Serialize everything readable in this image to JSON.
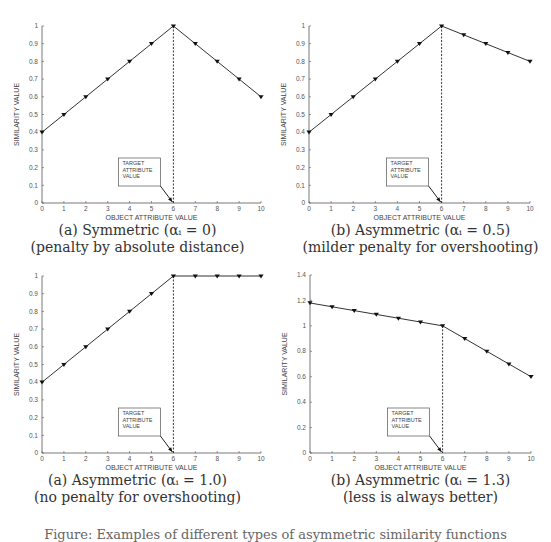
{
  "panels": [
    {
      "caption": {
        "line1": "(a) Symmetric (αᵢ = 0)",
        "line2": "(penalty by absolute distance)"
      }
    },
    {
      "caption": {
        "line1": "(b) Asymmetric (αᵢ = 0.5)",
        "line2": "(milder penalty for overshooting)"
      }
    },
    {
      "caption": {
        "line1": "(a) Asymmetric (αᵢ = 1.0)",
        "line2": "(no penalty for overshooting)"
      }
    },
    {
      "caption": {
        "line1": "(b) Asymmetric (αᵢ = 1.3)",
        "line2": "(less is always better)"
      }
    }
  ],
  "chart_data": [
    {
      "type": "line",
      "title": "(a) Symmetric (αi = 0) (penalty by absolute distance)",
      "xlabel": "OBJECT ATTRIBUTE VALUE",
      "ylabel": "SIMILARITY VALUE",
      "x": [
        0,
        1,
        2,
        3,
        4,
        5,
        6,
        7,
        8,
        9,
        10
      ],
      "series": [
        {
          "name": "similarity",
          "values": [
            0.4,
            0.5,
            0.6,
            0.7,
            0.8,
            0.9,
            1.0,
            0.9,
            0.8,
            0.7,
            0.6
          ]
        }
      ],
      "xlim": [
        0,
        10
      ],
      "ylim": [
        0,
        1
      ],
      "xticks": [
        "0",
        "1",
        "2",
        "3",
        "4",
        "5",
        "6",
        "7",
        "8",
        "9",
        "10"
      ],
      "yticks": [
        "0",
        "0.1",
        "0.2",
        "0.3",
        "0.4",
        "0.5",
        "0.6",
        "0.7",
        "0.8",
        "0.9",
        "1"
      ],
      "target_x": 6,
      "annotation": [
        "TARGET",
        "ATTRIBUTE",
        "VALUE"
      ],
      "grid": false,
      "marker": "triangle-down"
    },
    {
      "type": "line",
      "title": "(b) Asymmetric (αi = 0.5) (milder penalty for overshooting)",
      "xlabel": "OBJECT ATTRIBUTE VALUE",
      "ylabel": "SIMILARITY VALUE",
      "x": [
        0,
        1,
        2,
        3,
        4,
        5,
        6,
        7,
        8,
        9,
        10
      ],
      "series": [
        {
          "name": "similarity",
          "values": [
            0.4,
            0.5,
            0.6,
            0.7,
            0.8,
            0.9,
            1.0,
            0.95,
            0.9,
            0.85,
            0.8
          ]
        }
      ],
      "xlim": [
        0,
        10
      ],
      "ylim": [
        0,
        1
      ],
      "xticks": [
        "0",
        "1",
        "2",
        "3",
        "4",
        "5",
        "6",
        "7",
        "8",
        "9",
        "10"
      ],
      "yticks": [
        "0",
        "0.1",
        "0.2",
        "0.3",
        "0.4",
        "0.5",
        "0.6",
        "0.7",
        "0.8",
        "0.9",
        "1"
      ],
      "target_x": 6,
      "annotation": [
        "TARGET",
        "ATTRIBUTE",
        "VALUE"
      ],
      "grid": false,
      "marker": "triangle-down"
    },
    {
      "type": "line",
      "title": "(a) Asymmetric (αi = 1.0) (no penalty for overshooting)",
      "xlabel": "OBJECT ATTRIBUTE VALUE",
      "ylabel": "SIMILARITY VALUE",
      "x": [
        0,
        1,
        2,
        3,
        4,
        5,
        6,
        7,
        8,
        9,
        10
      ],
      "series": [
        {
          "name": "similarity",
          "values": [
            0.4,
            0.5,
            0.6,
            0.7,
            0.8,
            0.9,
            1.0,
            1.0,
            1.0,
            1.0,
            1.0
          ]
        }
      ],
      "xlim": [
        0,
        10
      ],
      "ylim": [
        0,
        1
      ],
      "xticks": [
        "0",
        "1",
        "2",
        "3",
        "4",
        "5",
        "6",
        "7",
        "8",
        "9",
        "10"
      ],
      "yticks": [
        "0",
        "0.1",
        "0.2",
        "0.3",
        "0.4",
        "0.5",
        "0.6",
        "0.7",
        "0.8",
        "0.9",
        "1"
      ],
      "target_x": 6,
      "annotation": [
        "TARGET",
        "ATTRIBUTE",
        "VALUE"
      ],
      "grid": false,
      "marker": "triangle-down"
    },
    {
      "type": "line",
      "title": "(b) Asymmetric (αi = 1.3) (less is always better)",
      "xlabel": "OBJECT ATTRIBUTE VALUE",
      "ylabel": "SIMILARITY VALUE",
      "x": [
        0,
        1,
        2,
        3,
        4,
        5,
        6,
        7,
        8,
        9,
        10
      ],
      "series": [
        {
          "name": "similarity",
          "values": [
            1.18,
            1.15,
            1.12,
            1.09,
            1.06,
            1.03,
            1.0,
            0.9,
            0.8,
            0.7,
            0.6
          ]
        }
      ],
      "xlim": [
        0,
        10
      ],
      "ylim": [
        0,
        1.4
      ],
      "xticks": [
        "0",
        "1",
        "2",
        "3",
        "4",
        "5",
        "6",
        "7",
        "8",
        "9",
        "10"
      ],
      "yticks": [
        "0",
        "0.2",
        "0.4",
        "0.6",
        "0.8",
        "1",
        "1.2",
        "1.4"
      ],
      "target_x": 6,
      "annotation": [
        "TARGET",
        "ATTRIBUTE",
        "VALUE"
      ],
      "grid": false,
      "marker": "triangle-down"
    }
  ],
  "figure_caption": "Figure: Examples of different types of asymmetric similarity functions"
}
